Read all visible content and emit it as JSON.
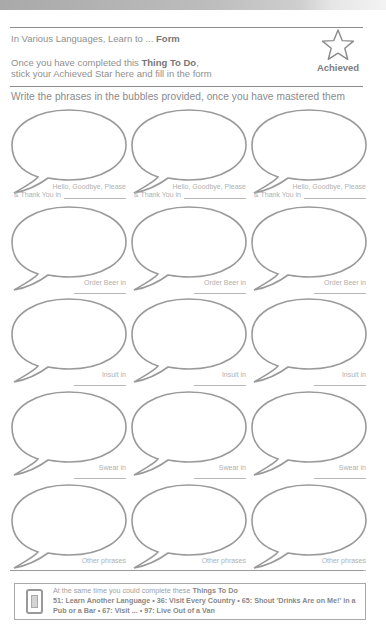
{
  "header": {
    "title_prefix": "In Various Languages, Learn to ... ",
    "title_bold": "Form",
    "intro_line1_prefix": "Once you have completed this ",
    "intro_line1_bold": "Thing To Do",
    "intro_line1_suffix": ",",
    "intro_line2": "stick your Achieved Star here and fill in the form",
    "achieved_label": "Achieved",
    "star_icon": "star-outline-icon"
  },
  "instructions": "Write the phrases in the bubbles provided, once you have mastered them",
  "bubble_rows": [
    {
      "label_line1": "Hello, Goodbye, Please",
      "label_line2": "& Thank You in",
      "columns": 3
    },
    {
      "label_line1": "Order Beer in",
      "columns": 3
    },
    {
      "label_line1": "Insult in",
      "columns": 3
    },
    {
      "label_line1": "Swear in",
      "columns": 3
    },
    {
      "label_line1": "Other phrases",
      "columns": 3
    }
  ],
  "footer": {
    "icon": "book-icon",
    "intro_prefix": "At the same time you could complete these ",
    "intro_bold": "Things To Do",
    "links_text": "51: Learn Another Language • 36: Visit Every Country • 65: Shout 'Drinks Are on Me!' in a Pub or a Bar • 67: Visit ... • 97: Live Out of a Van"
  },
  "colors": {
    "text": "#8a8a8a",
    "bubble_stroke": "#9a9a9a",
    "label": "#b0b0b0",
    "rule": "#8c8c8c"
  }
}
